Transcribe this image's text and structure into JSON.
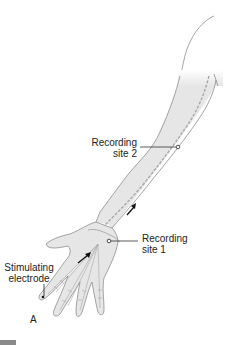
{
  "figure": {
    "panel_label": "A",
    "labels": {
      "recording_site_2": {
        "line1": "Recording",
        "line2": "site 2"
      },
      "recording_site_1": {
        "line1": "Recording",
        "line2": "site 1"
      },
      "stimulating_electrode": {
        "line1": "Stimulating",
        "line2": "electrode"
      }
    },
    "colors": {
      "skin": "#e6e6e6",
      "outline": "#8c8c8c",
      "nerve": "#a8a8a8",
      "text": "#222222",
      "arrow": "#111111"
    }
  }
}
